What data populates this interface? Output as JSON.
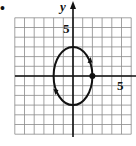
{
  "chart_data": {
    "type": "line",
    "title": "",
    "xlabel": "",
    "ylabel": "y",
    "xlim": [
      -6,
      6
    ],
    "ylim": [
      -6,
      6
    ],
    "grid": true,
    "tick_labels": {
      "x": "5",
      "y": "5"
    },
    "series": [
      {
        "name": "ellipse",
        "shape": "ellipse",
        "center": [
          0,
          0
        ],
        "semi_axis_x": 2,
        "semi_axis_y": 3,
        "direction": "counterclockwise",
        "start_point": [
          2,
          0
        ]
      }
    ],
    "marked_points": [
      {
        "x": 2,
        "y": 0
      }
    ]
  },
  "labels": {
    "y_axis": "y",
    "y_tick": "5",
    "x_tick": "5",
    "bullet": "•"
  }
}
